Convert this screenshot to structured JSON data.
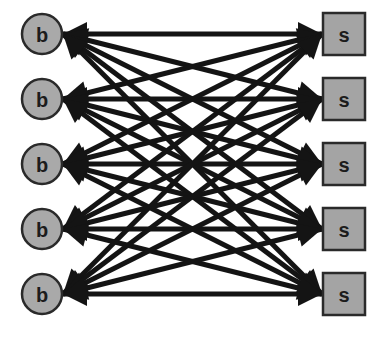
{
  "diagram": {
    "type": "complete-bipartite-graph",
    "directed": "bidirectional",
    "colors": {
      "node_fill": "#a9a9a9",
      "node_stroke": "#2a2a2a",
      "edge": "#141414",
      "background": "#ffffff"
    },
    "left_nodes": [
      {
        "id": "b1",
        "label": "b",
        "shape": "circle"
      },
      {
        "id": "b2",
        "label": "b",
        "shape": "circle"
      },
      {
        "id": "b3",
        "label": "b",
        "shape": "circle"
      },
      {
        "id": "b4",
        "label": "b",
        "shape": "circle"
      },
      {
        "id": "b5",
        "label": "b",
        "shape": "circle"
      }
    ],
    "right_nodes": [
      {
        "id": "s1",
        "label": "s",
        "shape": "square"
      },
      {
        "id": "s2",
        "label": "s",
        "shape": "square"
      },
      {
        "id": "s3",
        "label": "s",
        "shape": "square"
      },
      {
        "id": "s4",
        "label": "s",
        "shape": "square"
      },
      {
        "id": "s5",
        "label": "s",
        "shape": "square"
      }
    ],
    "edges": "every left node connected to every right node (25 edges), arrowheads at both ends"
  }
}
